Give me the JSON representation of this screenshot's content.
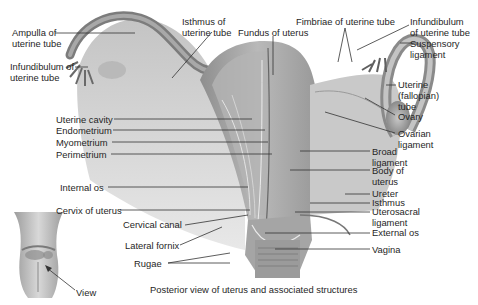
{
  "figure": {
    "caption": "Posterior view of uterus and associated structures"
  },
  "labels": {
    "ampulla": [
      "Ampulla of",
      "uterine tube"
    ],
    "infundibulum_left": [
      "Infundibulum of",
      "uterine tube"
    ],
    "isthmus_tube": [
      "Isthmus of",
      "uterine tube"
    ],
    "fundus": "Fundus of uterus",
    "fimbriae": "Fimbriae of uterine tube",
    "infundibulum_right": [
      "Infundibulum",
      "of uterine tube"
    ],
    "suspensory": [
      "Suspensory",
      "ligament"
    ],
    "uterine_tube": [
      "Uterine",
      "(fallopian)",
      "tube"
    ],
    "ovary": "Ovary",
    "ovarian_ligament": [
      "Ovarian",
      "ligament"
    ],
    "broad_ligament": [
      "Broad",
      "ligament"
    ],
    "body_of_uterus": [
      "Body of",
      "uterus"
    ],
    "ureter": "Ureter",
    "isthmus": "Isthmus",
    "uterosacral": [
      "Uterosacral",
      "ligament"
    ],
    "external_os": "External os",
    "vagina": "Vagina",
    "uterine_cavity": "Uterine cavity",
    "endometrium": "Endometrium",
    "myometrium": "Myometrium",
    "perimetrium": "Perimetrium",
    "internal_os": "Internal os",
    "cervix": "Cervix of uterus",
    "cervical_canal": "Cervical canal",
    "lateral_fornix": "Lateral fornix",
    "rugae": "Rugae",
    "view": "View"
  }
}
